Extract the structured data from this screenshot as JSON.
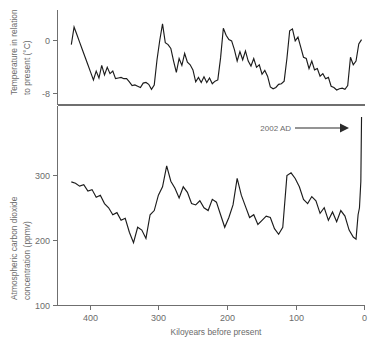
{
  "figure": {
    "title": "",
    "background_color": "#ffffff",
    "line_color": "#1c1c1c",
    "axis_color": "#6f6f6f",
    "text_color": "#6b6b6b"
  },
  "annotation": {
    "label": "2002 AD",
    "arrow_icon": "right-arrow-icon"
  },
  "chart_data": [
    {
      "type": "line",
      "id": "temperature-panel",
      "title": "",
      "xlabel": "",
      "ylabel": "Temperature in relation to present (°C)",
      "ylabel_lines": [
        "Temperature in relation",
        "to present (°C)"
      ],
      "xlim": [
        440,
        -5
      ],
      "ylim": [
        -10.5,
        4.5
      ],
      "grid": false,
      "legend": "none",
      "yticks": [
        0,
        -8
      ],
      "ytick_labels": [
        "0",
        "-8"
      ],
      "xticks": [
        400,
        300,
        200,
        100,
        0
      ],
      "xtick_labels": [],
      "series": [
        {
          "name": "Vostok temperature anomaly",
          "x": [
            420,
            416,
            412,
            408,
            404,
            400,
            396,
            392,
            388,
            384,
            380,
            376,
            372,
            368,
            364,
            360,
            356,
            352,
            348,
            344,
            340,
            336,
            332,
            328,
            324,
            320,
            316,
            312,
            308,
            304,
            300,
            296,
            292,
            288,
            284,
            280,
            276,
            272,
            268,
            264,
            260,
            256,
            252,
            248,
            244,
            240,
            236,
            232,
            228,
            224,
            220,
            216,
            212,
            208,
            204,
            200,
            196,
            192,
            188,
            184,
            180,
            176,
            172,
            168,
            164,
            160,
            156,
            152,
            148,
            144,
            140,
            136,
            132,
            128,
            124,
            120,
            116,
            112,
            108,
            104,
            100,
            96,
            92,
            88,
            84,
            80,
            76,
            72,
            68,
            64,
            60,
            56,
            52,
            48,
            44,
            40,
            36,
            32,
            28,
            24,
            20,
            16,
            12,
            8,
            4,
            0
          ],
          "y": [
            -1.0,
            1.8,
            0.6,
            -0.6,
            -1.8,
            -3.0,
            -4.2,
            -5.4,
            -6.6,
            -5.2,
            -6.3,
            -4.3,
            -5.8,
            -4.6,
            -5.6,
            -5.2,
            -6.4,
            -6.3,
            -6.2,
            -6.4,
            -6.4,
            -6.9,
            -7.5,
            -7.4,
            -7.6,
            -7.8,
            -7.1,
            -7.0,
            -7.3,
            -8.1,
            -7.4,
            -3.4,
            -0.3,
            2.3,
            -0.7,
            -1.0,
            -1.6,
            -3.6,
            -5.4,
            -3.2,
            -4.3,
            -2.4,
            -3.8,
            -4.2,
            -5.0,
            -6.9,
            -6.2,
            -7.0,
            -6.1,
            -7.0,
            -6.3,
            -7.2,
            -6.8,
            -6.6,
            -3.1,
            1.6,
            0.5,
            -0.2,
            -0.4,
            -1.8,
            -3.6,
            -2.1,
            -3.4,
            -2.0,
            -3.6,
            -4.4,
            -3.2,
            -4.6,
            -4.2,
            -5.7,
            -5.1,
            -6.0,
            -7.7,
            -8.0,
            -7.8,
            -7.3,
            -7.2,
            -6.8,
            -3.2,
            1.2,
            1.5,
            -0.4,
            0.2,
            -1.4,
            -3.0,
            -3.2,
            -4.8,
            -3.6,
            -5.0,
            -4.8,
            -6.0,
            -5.6,
            -6.4,
            -6.2,
            -7.6,
            -7.8,
            -8.2,
            -8.0,
            -7.9,
            -8.1,
            -7.5,
            -3.0,
            -4.2,
            -3.6,
            -0.9,
            -0.2
          ]
        }
      ]
    },
    {
      "type": "line",
      "id": "co2-panel",
      "title": "",
      "xlabel": "Kiloyears before present",
      "ylabel": "Atmospheric carbon dioxide concentration (ppmv)",
      "ylabel_lines": [
        "Atmospheric carbon dioxide",
        "concentration (ppmv)"
      ],
      "xlim": [
        440,
        -5
      ],
      "ylim": [
        100,
        380
      ],
      "grid": false,
      "legend": "none",
      "yticks": [
        100,
        200,
        300
      ],
      "ytick_labels": [
        "100",
        "200",
        "300"
      ],
      "xticks": [
        400,
        300,
        200,
        100,
        0
      ],
      "xtick_labels": [
        "400",
        "300",
        "200",
        "100",
        "0"
      ],
      "series": [
        {
          "name": "Vostok atmospheric CO2",
          "x": [
            420,
            414,
            408,
            402,
            396,
            390,
            384,
            378,
            372,
            366,
            360,
            354,
            348,
            342,
            336,
            330,
            324,
            318,
            312,
            306,
            300,
            294,
            288,
            282,
            276,
            270,
            264,
            258,
            252,
            246,
            240,
            234,
            228,
            222,
            216,
            210,
            204,
            198,
            192,
            186,
            180,
            174,
            168,
            162,
            156,
            150,
            144,
            138,
            132,
            126,
            120,
            114,
            108,
            102,
            96,
            90,
            84,
            78,
            72,
            66,
            60,
            54,
            48,
            42,
            36,
            30,
            24,
            18,
            12,
            8,
            5,
            3,
            1,
            0
          ],
          "y": [
            277,
            275,
            271,
            273,
            264,
            266,
            255,
            258,
            246,
            240,
            230,
            233,
            222,
            225,
            205,
            190,
            212,
            208,
            196,
            230,
            236,
            258,
            270,
            300,
            278,
            268,
            254,
            270,
            262,
            246,
            244,
            250,
            240,
            236,
            252,
            248,
            230,
            212,
            226,
            244,
            282,
            258,
            242,
            226,
            230,
            216,
            222,
            228,
            226,
            210,
            202,
            212,
            286,
            290,
            282,
            270,
            252,
            246,
            256,
            250,
            232,
            240,
            222,
            234,
            220,
            236,
            228,
            208,
            198,
            195,
            230,
            240,
            278,
            370
          ]
        }
      ]
    }
  ]
}
